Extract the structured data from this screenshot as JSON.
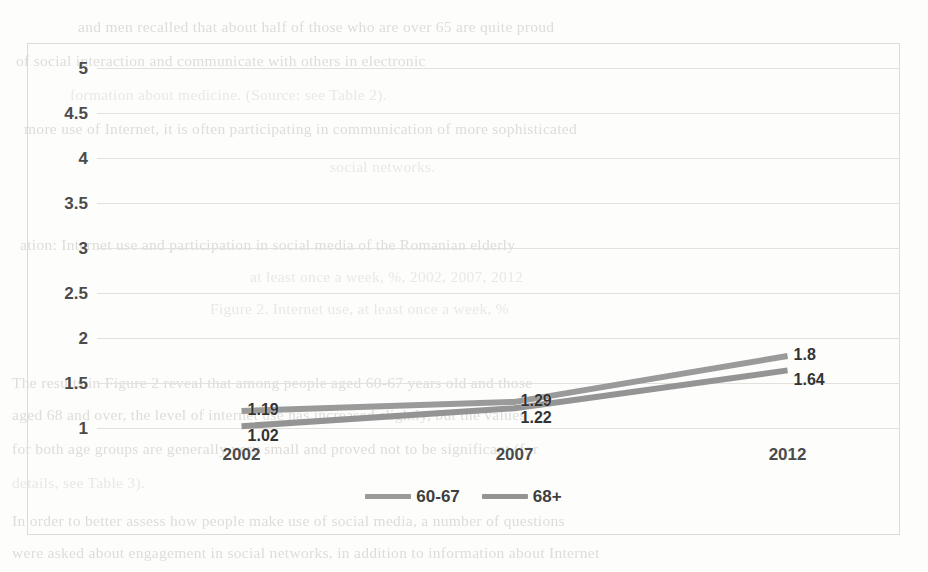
{
  "chart_data": {
    "type": "line",
    "title": "",
    "subtitle": "",
    "xlabel": "",
    "ylabel": "",
    "categories": [
      "2002",
      "2007",
      "2012"
    ],
    "ylim": [
      1,
      5
    ],
    "yticks": [
      "1",
      "1.5",
      "2",
      "2.5",
      "3",
      "3.5",
      "4",
      "4.5",
      "5"
    ],
    "ytick_values": [
      1,
      1.5,
      2,
      2.5,
      3,
      3.5,
      4,
      4.5,
      5
    ],
    "grid": true,
    "legend_position": "bottom",
    "series": [
      {
        "name": "60-67",
        "color": "#9a9a9a",
        "values": [
          1.19,
          1.29,
          1.8
        ],
        "labels": [
          "1.19",
          "1.29",
          "1.8"
        ]
      },
      {
        "name": "68+",
        "color": "#949494",
        "values": [
          1.02,
          1.22,
          1.64
        ],
        "labels": [
          "1.02",
          "1.22",
          "1.64"
        ]
      }
    ]
  },
  "legend": {
    "items": [
      {
        "label": "60-67"
      },
      {
        "label": "68+"
      }
    ]
  },
  "background_text": {
    "lines": [
      "and men recalled that about half of those who are over 65 are quite proud",
      "of social interaction and communicate with others in electronic",
      "formation about medicine. (Source: see Table 2).",
      "more use of Internet, it is often participating in communication of more sophisticated",
      "social networks.",
      "ation: Internet use and participation in social media of the Romanian elderly",
      "at least once a week, %, 2002, 2007, 2012",
      "Figure 2. Internet use, at least once a week, %",
      "The results in Figure 2 reveal that among people aged 60-67 years old and those",
      "aged 68 and over, the level of internet use has increased slightly, but the values",
      "for both age groups are generally very small and proved not to be significant (for",
      "details, see Table 3).",
      "In order to better assess how people make use of social media, a number of questions",
      "were asked about engagement in social networks, in addition to information about Internet"
    ]
  }
}
